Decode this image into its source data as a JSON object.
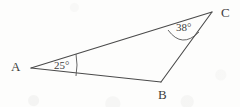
{
  "figure": {
    "type": "geometry-diagram",
    "shape": "triangle",
    "background_color": "#fdfdfc",
    "stroke_color": "#4a4a4a",
    "text_color": "#3d3d3d"
  },
  "vertices": [
    {
      "id": "A",
      "label": "A",
      "x": 31,
      "y": 68
    },
    {
      "id": "B",
      "label": "B",
      "x": 161,
      "y": 82
    },
    {
      "id": "C",
      "label": "C",
      "x": 212,
      "y": 12
    }
  ],
  "sides": [
    {
      "id": "AC",
      "from": "A",
      "to": "C"
    },
    {
      "id": "AB",
      "from": "A",
      "to": "B"
    },
    {
      "id": "BC",
      "from": "B",
      "to": "C"
    }
  ],
  "angles": [
    {
      "vertex": "A",
      "value": 25,
      "label": "25°",
      "marked": true
    },
    {
      "vertex": "C",
      "value": 38,
      "label": "38°",
      "marked": true
    },
    {
      "vertex": "B",
      "value": null,
      "label": "",
      "marked": false
    }
  ]
}
